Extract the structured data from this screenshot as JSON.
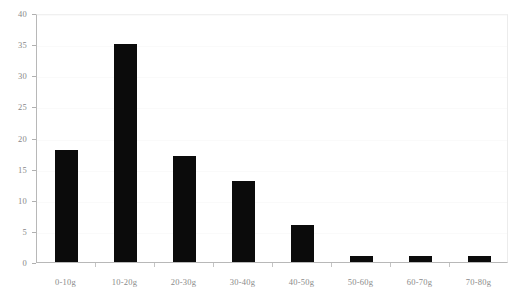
{
  "chart_data": {
    "type": "bar",
    "title": "",
    "subtitle": "",
    "xlabel": "",
    "ylabel": "",
    "categories": [
      "0-10g",
      "10-20g",
      "20-30g",
      "30-40g",
      "40-50g",
      "50-60g",
      "60-70g",
      "70-80g"
    ],
    "values": [
      18,
      35,
      17,
      13,
      6,
      1,
      1,
      1
    ],
    "series": [
      {
        "name": "",
        "values": [
          18,
          35,
          17,
          13,
          6,
          1,
          1,
          1
        ]
      }
    ],
    "ylim": [
      0,
      40
    ],
    "xlim_categories": 8,
    "y_ticks": [
      0,
      5,
      10,
      15,
      20,
      25,
      30,
      35,
      40
    ],
    "y_tick_labels": [
      "0",
      "5",
      "10",
      "15",
      "20",
      "25",
      "30",
      "35",
      "40"
    ],
    "grid": true,
    "grid_axis": "y",
    "legend": false,
    "legend_position": "none",
    "annotations": [],
    "colors": {
      "bar": "#0b0b0b",
      "background": "#ffffff",
      "gridline": "#fafafa",
      "axis_line": "#b8b8b8",
      "tick_label": "#888888",
      "plot_border": "#ececec"
    }
  }
}
